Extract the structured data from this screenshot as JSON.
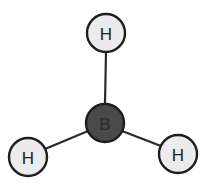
{
  "diagram": {
    "central_atom": {
      "symbol": "B",
      "cx": 105,
      "cy": 123,
      "r": 19
    },
    "atoms": [
      {
        "id": "h-top",
        "symbol": "H",
        "cx": 106,
        "cy": 33,
        "r": 19
      },
      {
        "id": "h-left",
        "symbol": "H",
        "cx": 28,
        "cy": 157,
        "r": 19
      },
      {
        "id": "h-right",
        "symbol": "H",
        "cx": 178,
        "cy": 154,
        "r": 19
      }
    ],
    "colors": {
      "hydrogen_fill": "#ececec",
      "boron_fill": "#4a4a4a",
      "outline": "#1e1e1e"
    }
  }
}
